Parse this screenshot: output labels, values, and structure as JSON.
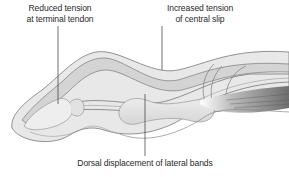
{
  "diagram": {
    "labels": [
      {
        "id": "terminal-tendon",
        "lines": [
          "Reduced tension",
          "at terminal tendon"
        ]
      },
      {
        "id": "central-slip",
        "lines": [
          "Increased tension",
          "of central slip"
        ]
      },
      {
        "id": "lateral-bands",
        "lines": [
          "Dorsal displacement of lateral bands"
        ]
      }
    ],
    "colors": {
      "outline": "#7a7a7a",
      "tendon_fill": "#d4d4d4",
      "bone_fill": "#e6e6e6",
      "muscle_fill": "#9a9a9a",
      "leader_line": "#333333",
      "text": "#2a2a2a"
    }
  }
}
